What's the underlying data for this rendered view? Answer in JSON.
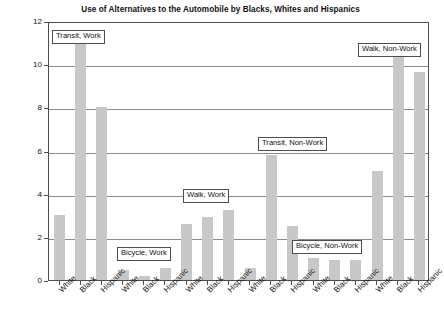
{
  "chart_data": {
    "type": "bar",
    "title": "Use of Alternatives to the Automobile by Blacks, Whites and Hispanics",
    "xlabel": "",
    "ylabel": "Mode Share (% of Trips)",
    "ylim": [
      0,
      12
    ],
    "yticks": [
      0,
      2,
      4,
      6,
      8,
      10,
      12
    ],
    "ytick_labels": [
      "0",
      "2",
      "4",
      "6",
      "8",
      "10",
      "12"
    ],
    "grid": true,
    "legend": "none",
    "categories": [
      "White",
      "Black",
      "Hispanic",
      "White",
      "Black",
      "Hispanic",
      "White",
      "Black",
      "Hispanic",
      "White",
      "Black",
      "Hispanic",
      "White",
      "Black",
      "Hispanic",
      "White",
      "Black",
      "Hispanic"
    ],
    "values": [
      3.0,
      11.3,
      8.0,
      0.45,
      0.2,
      0.55,
      2.6,
      2.9,
      3.25,
      0.55,
      5.8,
      2.5,
      1.0,
      0.95,
      0.95,
      5.05,
      10.7,
      9.65
    ],
    "groups": [
      {
        "label": "Transit, Work",
        "categories": [
          "White",
          "Black",
          "Hispanic"
        ],
        "values": [
          3.0,
          11.3,
          8.0
        ]
      },
      {
        "label": "Bicycle, Work",
        "categories": [
          "White",
          "Black",
          "Hispanic"
        ],
        "values": [
          0.45,
          0.2,
          0.55
        ]
      },
      {
        "label": "Walk, Work",
        "categories": [
          "White",
          "Black",
          "Hispanic"
        ],
        "values": [
          2.6,
          2.9,
          3.25
        ]
      },
      {
        "label": "Transit, Non-Work",
        "categories": [
          "White",
          "Black",
          "Hispanic"
        ],
        "values": [
          0.55,
          5.8,
          2.5
        ]
      },
      {
        "label": "Bicycle, Non-Work",
        "categories": [
          "White",
          "Black",
          "Hispanic"
        ],
        "values": [
          1.0,
          0.95,
          0.95
        ]
      },
      {
        "label": "Walk, Non-Work",
        "categories": [
          "White",
          "Black",
          "Hispanic"
        ],
        "values": [
          5.05,
          10.7,
          9.65
        ]
      }
    ],
    "annotations": [
      {
        "text": "Transit, Work"
      },
      {
        "text": "Bicycle, Work"
      },
      {
        "text": "Walk, Work"
      },
      {
        "text": "Transit, Non-Work"
      },
      {
        "text": "Bicycle, Non-Work"
      },
      {
        "text": "Walk, Non-Work"
      }
    ],
    "colors": {
      "bar_fill": "#c8c8c8",
      "axis": "#4d4d4d",
      "gridline": "#8c8c8c",
      "text": "#111111",
      "background": "#ffffff"
    }
  }
}
